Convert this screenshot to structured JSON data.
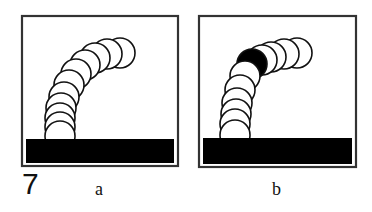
{
  "figure": {
    "number": "7",
    "panels": [
      {
        "label": "a",
        "frame": {
          "x": 22,
          "y": 16,
          "w": 156,
          "h": 150
        },
        "base": {
          "x": 26,
          "y": 139,
          "w": 148,
          "h": 24
        },
        "circles": [
          {
            "cx": 120,
            "cy": 53
          },
          {
            "cx": 107,
            "cy": 54
          },
          {
            "cx": 95,
            "cy": 58
          },
          {
            "cx": 85,
            "cy": 65
          },
          {
            "cx": 76,
            "cy": 74
          },
          {
            "cx": 69,
            "cy": 85
          },
          {
            "cx": 64,
            "cy": 97
          },
          {
            "cx": 61,
            "cy": 108
          },
          {
            "cx": 60,
            "cy": 118
          },
          {
            "cx": 60,
            "cy": 127
          },
          {
            "cx": 60,
            "cy": 136
          }
        ],
        "highlighted_index": -1
      },
      {
        "label": "b",
        "frame": {
          "x": 199,
          "y": 16,
          "w": 157,
          "h": 151
        },
        "base": {
          "x": 203,
          "y": 138,
          "w": 149,
          "h": 26
        },
        "circles": [
          {
            "cx": 297,
            "cy": 53
          },
          {
            "cx": 284,
            "cy": 54
          },
          {
            "cx": 271,
            "cy": 57
          },
          {
            "cx": 262,
            "cy": 60
          },
          {
            "cx": 252,
            "cy": 64
          },
          {
            "cx": 245,
            "cy": 76
          },
          {
            "cx": 240,
            "cy": 90
          },
          {
            "cx": 237,
            "cy": 103
          },
          {
            "cx": 236,
            "cy": 114
          },
          {
            "cx": 235,
            "cy": 124
          },
          {
            "cx": 235,
            "cy": 135
          }
        ],
        "highlighted_index": 4
      }
    ],
    "circle_radius": 15,
    "colors": {
      "stroke": "#111111",
      "fill": "#ffffff",
      "highlight": "#000000",
      "base": "#000000",
      "frame": "#333333"
    }
  }
}
